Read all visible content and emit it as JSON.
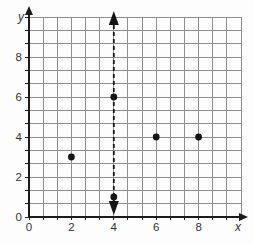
{
  "chart_data": {
    "type": "scatter",
    "title": "",
    "xlabel": "x",
    "ylabel": "y",
    "xlim": [
      0,
      10
    ],
    "ylim": [
      0,
      10
    ],
    "x_tick_values": [
      0,
      2,
      4,
      6,
      8
    ],
    "x_tick_labels": [
      "0",
      "2",
      "4",
      "6",
      "8"
    ],
    "y_tick_values": [
      0,
      2,
      4,
      6,
      8
    ],
    "y_tick_labels": [
      "0",
      "2",
      "4",
      "6",
      "8"
    ],
    "grid": "on",
    "grid_cells_per_two_units": 3,
    "grid_total_cells": 15,
    "legend": "none",
    "points": [
      {
        "x": 2,
        "y": 3
      },
      {
        "x": 4,
        "y": 1
      },
      {
        "x": 4,
        "y": 6
      },
      {
        "x": 6,
        "y": 4
      },
      {
        "x": 8,
        "y": 4
      }
    ],
    "annotations": [
      {
        "type": "vertical_line",
        "x": 4,
        "style": "dashed",
        "arrows": "both_ends",
        "from_y": 0.2,
        "to_y": 10.3
      }
    ],
    "colors": {
      "background": "#fdfdfd",
      "plot_background": "#fdfdfd",
      "grid": "#8f8f8f",
      "axis": "#1b1b1b",
      "point": "#151515",
      "dashed_line": "#151515",
      "text": "#333333"
    }
  }
}
